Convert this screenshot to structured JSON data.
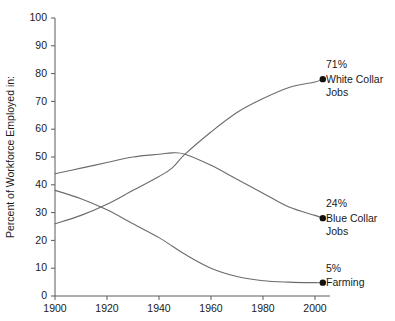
{
  "chart_data": {
    "type": "line",
    "title": "",
    "xlabel": "",
    "ylabel": "Percent of Workforce Employed in:",
    "xlim": [
      1900,
      2010
    ],
    "ylim": [
      0,
      100
    ],
    "grid": false,
    "legend_position": "right-annotations",
    "xticks": [
      "1900",
      "1920",
      "1940",
      "1960",
      "1980",
      "2000"
    ],
    "xtick_values": [
      1900,
      1920,
      1940,
      1960,
      1980,
      2000
    ],
    "yticks": [
      "0",
      "10",
      "20",
      "30",
      "40",
      "50",
      "60",
      "70",
      "80",
      "90",
      "100"
    ],
    "ytick_values": [
      0,
      10,
      20,
      30,
      40,
      50,
      60,
      70,
      80,
      90,
      100
    ],
    "x": [
      1900,
      1910,
      1920,
      1930,
      1940,
      1945,
      1950,
      1960,
      1970,
      1980,
      1990,
      2000,
      2003
    ],
    "series": [
      {
        "name": "White Collar Jobs",
        "end_value_label": "71%",
        "label_line1": "White Collar",
        "label_line2": "Jobs",
        "color": "#6b6b6b",
        "values": [
          26,
          29,
          33,
          38,
          43,
          46,
          51,
          59,
          66,
          71,
          75,
          77,
          78
        ]
      },
      {
        "name": "Blue Collar Jobs",
        "end_value_label": "24%",
        "label_line1": "Blue Collar",
        "label_line2": "Jobs",
        "color": "#6b6b6b",
        "values": [
          44,
          46,
          48,
          50,
          51,
          51.5,
          51,
          47,
          42,
          37,
          32,
          29,
          28
        ]
      },
      {
        "name": "Farming",
        "end_value_label": "5%",
        "label_line1": "Farming",
        "label_line2": "",
        "color": "#6b6b6b",
        "values": [
          38,
          35,
          31,
          26,
          21,
          18,
          15,
          10,
          7,
          5.5,
          5,
          4.8,
          4.8
        ]
      }
    ],
    "annotations": [
      {
        "value": "71%",
        "line1": "White Collar",
        "line2": "Jobs",
        "at_x": 2003,
        "at_y": 78
      },
      {
        "value": "24%",
        "line1": "Blue Collar",
        "line2": "Jobs",
        "at_x": 2003,
        "at_y": 28
      },
      {
        "value": "5%",
        "line1": "Farming",
        "line2": "",
        "at_x": 2003,
        "at_y": 4.8
      }
    ]
  }
}
